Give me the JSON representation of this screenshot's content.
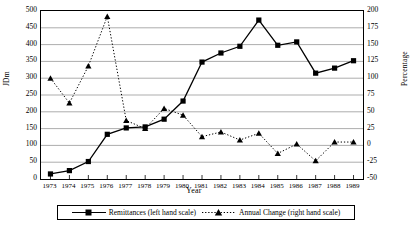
{
  "chart_data": {
    "type": "line",
    "title": "",
    "xlabel": "Year",
    "ylabel": "JDm",
    "y2label": "Percentage",
    "categories": [
      "1973",
      "1974",
      "1975",
      "1976",
      "1977",
      "1978",
      "1979",
      "1980",
      "1981",
      "1982",
      "1983",
      "1984",
      "1985",
      "1986",
      "1987",
      "1988",
      "1989"
    ],
    "ylim": [
      0,
      500
    ],
    "ytick_step": 50,
    "yticks": [
      "500",
      "450",
      "400",
      "350",
      "300",
      "250",
      "200",
      "150",
      "100",
      "50",
      "0"
    ],
    "y2lim": [
      -50,
      200
    ],
    "y2tick_step": 25,
    "y2ticks": [
      "200",
      "175",
      "150",
      "125",
      "100",
      "75",
      "50",
      "25",
      "0",
      "-25",
      "-50"
    ],
    "grid": true,
    "legend_position": "bottom",
    "series": [
      {
        "name": "Remittances (left hand scale)",
        "axis": "left",
        "marker": "square",
        "linestyle": "solid",
        "color": "#000000",
        "values": [
          15,
          25,
          52,
          133,
          152,
          155,
          178,
          232,
          348,
          375,
          395,
          473,
          398,
          408,
          315,
          330,
          352
        ]
      },
      {
        "name": "Annual Change (right hand scale)",
        "axis": "right",
        "marker": "triangle",
        "linestyle": "dotted",
        "color": "#000000",
        "values": [
          100,
          63,
          118,
          192,
          37,
          25,
          55,
          45,
          13,
          20,
          8,
          18,
          -12,
          2,
          -23,
          5,
          5
        ]
      }
    ]
  },
  "legend": {
    "items": [
      {
        "label": "Remittances (left hand scale)",
        "marker": "square",
        "linestyle": "solid"
      },
      {
        "label": "Annual Change (right hand scale)",
        "marker": "triangle",
        "linestyle": "dotted"
      }
    ]
  }
}
